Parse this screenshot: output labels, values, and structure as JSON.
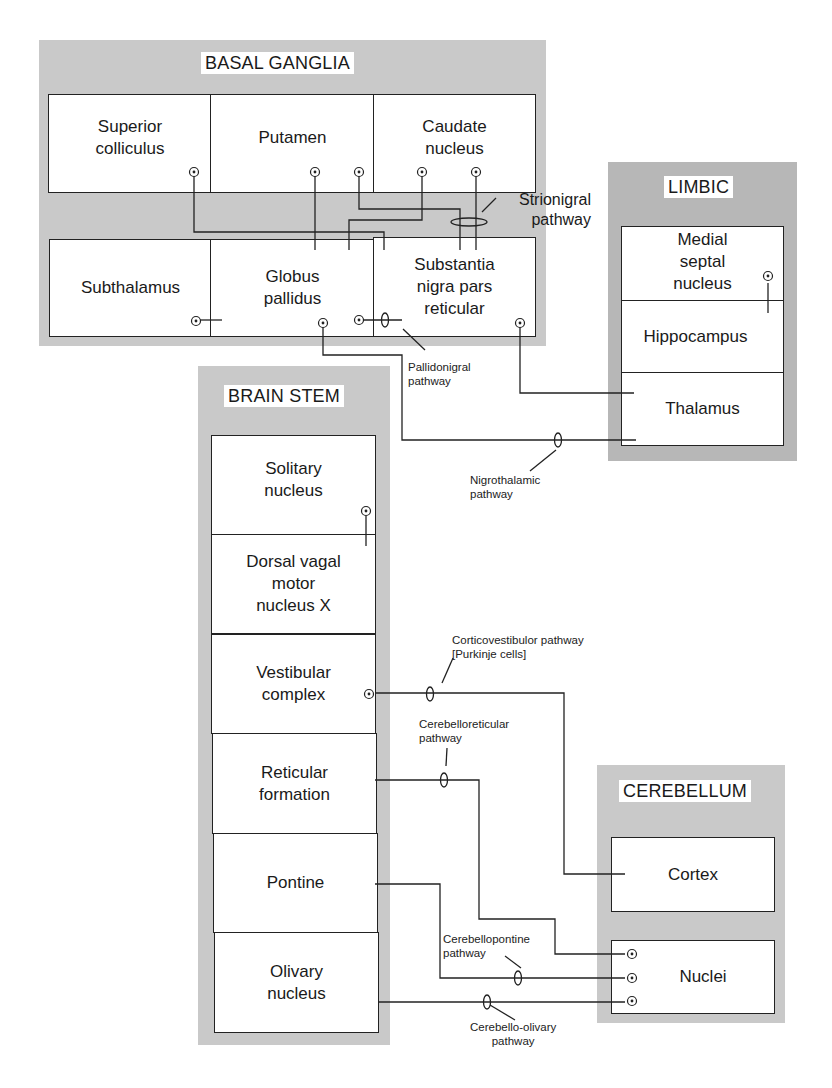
{
  "diagram": {
    "type": "neural pathway block diagram",
    "groups": {
      "basal_ganglia": {
        "title": "BASAL GANGLIA",
        "cells": {
          "superior_colliculus": "Superior\ncolliculus",
          "putamen": "Putamen",
          "caudate_nucleus": "Caudate\nnucleus",
          "subthalamus": "Subthalamus",
          "globus_pallidus": "Globus\npallidus",
          "substantia_nigra": "Substantia\nnigra pars\nreticular"
        }
      },
      "limbic": {
        "title": "LIMBIC",
        "cells": {
          "medial_septal_nucleus": "Medial\nseptal\nnucleus",
          "hippocampus": "Hippocampus",
          "thalamus": "Thalamus"
        }
      },
      "brain_stem": {
        "title": "BRAIN STEM",
        "cells": {
          "solitary_nucleus": "Solitary\nnucleus",
          "dorsal_vagal": "Dorsal vagal\nmotor\nnucleus X",
          "vestibular_complex": "Vestibular\ncomplex",
          "reticular_formation": "Reticular\nformation",
          "pontine": "Pontine",
          "olivary_nucleus": "Olivary\nnucleus"
        }
      },
      "cerebellum": {
        "title": "CEREBELLUM",
        "cells": {
          "cortex": "Cortex",
          "nuclei": "Nuclei"
        }
      }
    },
    "pathways": {
      "strionigral": "Strionigral\npathway",
      "pallidonigral": "Pallidonigral\npathway",
      "nigrothalamic": "Nigrothalamic\npathway",
      "corticovestibulor": "Corticovestibulor pathway\n[Purkinje cells]",
      "cerebelloreticular": "Cerebelloreticular\npathway",
      "cerebellopontine": "Cerebellopontine\npathway",
      "cerebello_olivary": "Cerebello-olivary\npathway"
    },
    "colors": {
      "panel_gray": "#c9c9c9",
      "panel_dark_gray": "#b7b7b7",
      "line": "#222222",
      "cell_fill": "#ffffff"
    }
  }
}
